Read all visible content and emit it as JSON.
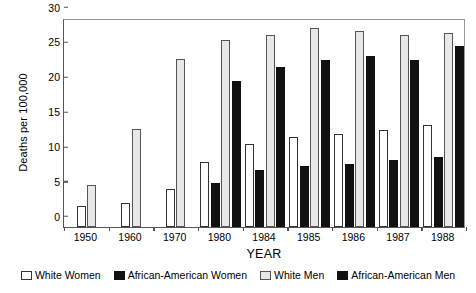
{
  "chart_data": {
    "type": "bar",
    "title": "",
    "xlabel": "YEAR",
    "ylabel": "Deaths per 100,000",
    "ylim": [
      0,
      30
    ],
    "yticks": [
      0,
      5,
      10,
      15,
      20,
      25,
      30
    ],
    "grid": false,
    "legend_position": "bottom",
    "categories": [
      "1950",
      "1960",
      "1970",
      "1980",
      "1984",
      "1985",
      "1986",
      "1987",
      "1988"
    ],
    "series": [
      {
        "name": "White Women",
        "color": "#ffffff",
        "values": [
          3.0,
          3.4,
          5.4,
          9.3,
          11.9,
          12.9,
          13.4,
          13.9,
          14.6
        ]
      },
      {
        "name": "African-American Women",
        "color": "#111111",
        "values": [
          null,
          null,
          null,
          6.3,
          8.2,
          8.8,
          9.1,
          9.6,
          10.0
        ]
      },
      {
        "name": "White Men",
        "color": "#e8e8e8",
        "values": [
          6.1,
          14.0,
          24.1,
          26.8,
          27.6,
          28.5,
          28.2,
          27.5,
          27.9
        ]
      },
      {
        "name": "African-American Men",
        "color": "#111111",
        "values": [
          null,
          null,
          null,
          21.0,
          23.0,
          24.0,
          24.6,
          24.0,
          26.0
        ]
      }
    ]
  },
  "legend": {
    "items": [
      {
        "label": "White Women",
        "swatch": "white-square-outline-icon"
      },
      {
        "label": "African-American Women",
        "swatch": "black-square-icon"
      },
      {
        "label": "White Men",
        "swatch": "light-gray-square-icon"
      },
      {
        "label": "African-American Men",
        "swatch": "black-square-icon"
      }
    ]
  }
}
